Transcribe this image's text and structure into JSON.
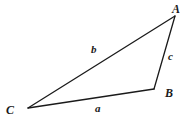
{
  "figure": {
    "type": "geometry-diagram",
    "shape": "triangle",
    "background_color": "#ffffff",
    "stroke_color": "#1a1a1a",
    "text_color": "#1a1a1a",
    "stroke_width": 1.3,
    "width": 191,
    "height": 124
  },
  "vertices": [
    {
      "id": "A",
      "label": "A",
      "x": 175,
      "y": 16
    },
    {
      "id": "B",
      "label": "B",
      "x": 154,
      "y": 89
    },
    {
      "id": "C",
      "label": "C",
      "x": 28,
      "y": 108
    }
  ],
  "sides": [
    {
      "id": "a",
      "label": "a",
      "from": "B",
      "to": "C",
      "description": "bottom side opposite vertex A"
    },
    {
      "id": "b",
      "label": "b",
      "from": "C",
      "to": "A",
      "description": "long upper-left diagonal side opposite vertex B"
    },
    {
      "id": "c",
      "label": "c",
      "from": "A",
      "to": "B",
      "description": "short right side opposite vertex C"
    }
  ],
  "labels": {
    "vertex_A": "A",
    "vertex_B": "B",
    "vertex_C": "C",
    "side_a": "a",
    "side_b": "b",
    "side_c": "c"
  }
}
